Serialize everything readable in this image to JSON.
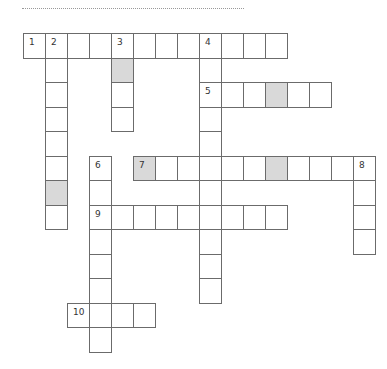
{
  "puzzle": {
    "cell_w": 22,
    "cell_h": 24.5,
    "origin_x": 23,
    "origin_y": 33,
    "shade_color": "#d9d9d9",
    "words": [
      {
        "number": "1",
        "dir": "across",
        "row": 0,
        "col": 0,
        "length": 12
      },
      {
        "number": "2",
        "dir": "down",
        "row": 0,
        "col": 1,
        "length": 8,
        "shaded": [
          6
        ]
      },
      {
        "number": "3",
        "dir": "down",
        "row": 0,
        "col": 4,
        "length": 4,
        "shaded": [
          1
        ]
      },
      {
        "number": "4",
        "dir": "down",
        "row": 0,
        "col": 8,
        "length": 11
      },
      {
        "number": "5",
        "dir": "across",
        "row": 2,
        "col": 8,
        "length": 6,
        "shaded": [
          3
        ]
      },
      {
        "number": "6",
        "dir": "down",
        "row": 5,
        "col": 3,
        "length": 8
      },
      {
        "number": "7",
        "dir": "across",
        "row": 5,
        "col": 5,
        "length": 11,
        "shaded": [
          0,
          6
        ]
      },
      {
        "number": "8",
        "dir": "down",
        "row": 5,
        "col": 15,
        "length": 4
      },
      {
        "number": "9",
        "dir": "across",
        "row": 7,
        "col": 3,
        "length": 9
      },
      {
        "number": "10",
        "dir": "across",
        "row": 11,
        "col": 2,
        "length": 4
      }
    ]
  }
}
